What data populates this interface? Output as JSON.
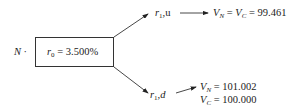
{
  "node_label": "N ·",
  "root": {
    "var": "r",
    "sub": "0",
    "value": "= 3.500%"
  },
  "up": {
    "var": "r",
    "sub": "1",
    "suffix": ",u",
    "vn": "V",
    "vn_sub": "N",
    "vc": "V",
    "vc_sub": "C",
    "value": "= 99.461"
  },
  "down": {
    "var": "r",
    "sub": "1",
    "suffix": ",d",
    "vn": "V",
    "vn_sub": "N",
    "vn_value": "= 101.002",
    "vc": "V",
    "vc_sub": "C",
    "vc_value": "= 100.000"
  }
}
